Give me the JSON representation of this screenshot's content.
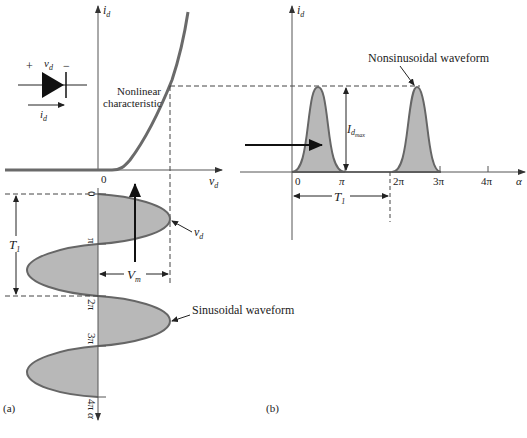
{
  "colors": {
    "curve": "#666666",
    "fill": "#b8b8b8",
    "axis": "#555555",
    "text": "#222222",
    "arrow": "#111111"
  },
  "panel_a": {
    "label": "(a)",
    "y_axis_label": "i",
    "y_axis_sub": "d",
    "x_axis_label": "v",
    "x_axis_sub": "d",
    "origin": "0",
    "curve_annotation_line1": "Nonlinear",
    "curve_annotation_line2": "characteristic",
    "diode": {
      "plus": "+",
      "minus": "−",
      "voltage": "v",
      "voltage_sub": "d",
      "current": "i",
      "current_sub": "d"
    },
    "sine": {
      "ticks": [
        "0",
        "π",
        "2π",
        "3π",
        "4π"
      ],
      "axis_label": "α",
      "period_label": "T",
      "period_sub": "1",
      "amplitude_label": "V",
      "amplitude_sub": "m",
      "vd_label": "v",
      "vd_sub": "d",
      "annotation": "Sinusoidal waveform"
    }
  },
  "panel_b": {
    "label": "(b)",
    "y_axis_label": "i",
    "y_axis_sub": "d",
    "x_axis_label": "α",
    "ticks": [
      "0",
      "π",
      "2π",
      "3π",
      "4π"
    ],
    "peak_label": "I",
    "peak_sub": "d",
    "peak_subsub": "max",
    "period_label": "T",
    "period_sub": "1",
    "annotation": "Nonsinusoidal waveform"
  }
}
